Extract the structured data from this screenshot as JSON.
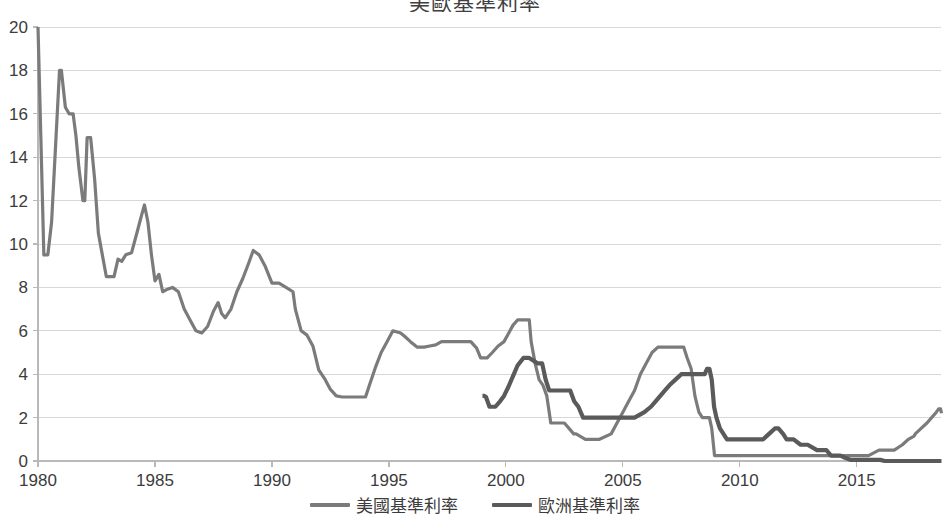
{
  "chart_data": {
    "type": "line",
    "title": "美歐基準利率",
    "xlabel": "",
    "ylabel": "",
    "xlim": [
      1980,
      2018.6
    ],
    "ylim": [
      0,
      20
    ],
    "ytick_values": [
      0,
      2,
      4,
      6,
      8,
      10,
      12,
      14,
      16,
      18,
      20
    ],
    "ytick_labels": [
      "0",
      "2",
      "4",
      "6",
      "8",
      "10",
      "12",
      "14",
      "16",
      "18",
      "20"
    ],
    "xtick_values": [
      1980,
      1985,
      1990,
      1995,
      2000,
      2005,
      2010,
      2015
    ],
    "xtick_labels": [
      "1980",
      "1985",
      "1990",
      "1995",
      "2000",
      "2005",
      "2010",
      "2015"
    ],
    "grid": "horizontal",
    "legend_position": "bottom",
    "series": [
      {
        "name": "美國基準利率",
        "color": "#7b7b7b",
        "width": 3.2,
        "points": [
          [
            1980.0,
            20.0
          ],
          [
            1980.12,
            15.0
          ],
          [
            1980.25,
            9.5
          ],
          [
            1980.42,
            9.5
          ],
          [
            1980.58,
            11.0
          ],
          [
            1980.75,
            14.5
          ],
          [
            1980.92,
            18.0
          ],
          [
            1981.0,
            18.0
          ],
          [
            1981.17,
            16.3
          ],
          [
            1981.33,
            16.0
          ],
          [
            1981.5,
            16.0
          ],
          [
            1981.62,
            15.0
          ],
          [
            1981.75,
            13.5
          ],
          [
            1981.92,
            12.0
          ],
          [
            1982.0,
            12.0
          ],
          [
            1982.1,
            14.9
          ],
          [
            1982.25,
            14.9
          ],
          [
            1982.42,
            13.0
          ],
          [
            1982.58,
            10.5
          ],
          [
            1982.75,
            9.5
          ],
          [
            1982.92,
            8.5
          ],
          [
            1983.0,
            8.5
          ],
          [
            1983.25,
            8.5
          ],
          [
            1983.42,
            9.3
          ],
          [
            1983.58,
            9.2
          ],
          [
            1983.75,
            9.5
          ],
          [
            1984.0,
            9.6
          ],
          [
            1984.25,
            10.6
          ],
          [
            1984.42,
            11.3
          ],
          [
            1984.55,
            11.8
          ],
          [
            1984.7,
            11.0
          ],
          [
            1984.85,
            9.5
          ],
          [
            1985.0,
            8.3
          ],
          [
            1985.17,
            8.6
          ],
          [
            1985.33,
            7.8
          ],
          [
            1985.5,
            7.9
          ],
          [
            1985.75,
            8.0
          ],
          [
            1986.0,
            7.8
          ],
          [
            1986.25,
            7.0
          ],
          [
            1986.5,
            6.5
          ],
          [
            1986.75,
            6.0
          ],
          [
            1987.0,
            5.9
          ],
          [
            1987.25,
            6.2
          ],
          [
            1987.5,
            6.9
          ],
          [
            1987.7,
            7.3
          ],
          [
            1987.85,
            6.8
          ],
          [
            1988.0,
            6.6
          ],
          [
            1988.25,
            7.0
          ],
          [
            1988.5,
            7.8
          ],
          [
            1988.75,
            8.4
          ],
          [
            1989.0,
            9.1
          ],
          [
            1989.2,
            9.7
          ],
          [
            1989.45,
            9.5
          ],
          [
            1989.7,
            9.0
          ],
          [
            1990.0,
            8.2
          ],
          [
            1990.3,
            8.2
          ],
          [
            1990.6,
            8.0
          ],
          [
            1990.9,
            7.8
          ],
          [
            1991.0,
            7.0
          ],
          [
            1991.25,
            6.0
          ],
          [
            1991.5,
            5.8
          ],
          [
            1991.75,
            5.3
          ],
          [
            1992.0,
            4.2
          ],
          [
            1992.25,
            3.8
          ],
          [
            1992.5,
            3.3
          ],
          [
            1992.75,
            3.0
          ],
          [
            1993.0,
            2.95
          ],
          [
            1993.5,
            2.95
          ],
          [
            1994.0,
            2.95
          ],
          [
            1994.17,
            3.5
          ],
          [
            1994.42,
            4.3
          ],
          [
            1994.67,
            5.0
          ],
          [
            1994.92,
            5.5
          ],
          [
            1995.17,
            6.0
          ],
          [
            1995.5,
            5.9
          ],
          [
            1995.67,
            5.75
          ],
          [
            1995.92,
            5.5
          ],
          [
            1996.2,
            5.25
          ],
          [
            1996.5,
            5.25
          ],
          [
            1996.75,
            5.3
          ],
          [
            1997.0,
            5.35
          ],
          [
            1997.25,
            5.5
          ],
          [
            1997.6,
            5.5
          ],
          [
            1998.0,
            5.5
          ],
          [
            1998.5,
            5.5
          ],
          [
            1998.75,
            5.2
          ],
          [
            1998.92,
            4.75
          ],
          [
            1999.2,
            4.75
          ],
          [
            1999.42,
            5.0
          ],
          [
            1999.67,
            5.3
          ],
          [
            1999.92,
            5.5
          ],
          [
            2000.1,
            5.85
          ],
          [
            2000.3,
            6.25
          ],
          [
            2000.5,
            6.5
          ],
          [
            2000.9,
            6.5
          ],
          [
            2001.0,
            6.5
          ],
          [
            2001.08,
            5.5
          ],
          [
            2001.25,
            4.5
          ],
          [
            2001.42,
            3.75
          ],
          [
            2001.58,
            3.5
          ],
          [
            2001.75,
            3.0
          ],
          [
            2001.92,
            1.75
          ],
          [
            2002.0,
            1.75
          ],
          [
            2002.5,
            1.75
          ],
          [
            2002.9,
            1.25
          ],
          [
            2003.0,
            1.25
          ],
          [
            2003.4,
            1.0
          ],
          [
            2003.6,
            1.0
          ],
          [
            2004.0,
            1.0
          ],
          [
            2004.5,
            1.25
          ],
          [
            2004.75,
            1.75
          ],
          [
            2005.0,
            2.25
          ],
          [
            2005.25,
            2.75
          ],
          [
            2005.5,
            3.25
          ],
          [
            2005.75,
            4.0
          ],
          [
            2006.0,
            4.5
          ],
          [
            2006.25,
            5.0
          ],
          [
            2006.5,
            5.25
          ],
          [
            2006.9,
            5.25
          ],
          [
            2007.4,
            5.25
          ],
          [
            2007.6,
            5.25
          ],
          [
            2007.75,
            4.75
          ],
          [
            2007.92,
            4.25
          ],
          [
            2008.08,
            3.0
          ],
          [
            2008.25,
            2.25
          ],
          [
            2008.4,
            2.0
          ],
          [
            2008.7,
            2.0
          ],
          [
            2008.8,
            1.5
          ],
          [
            2008.92,
            0.25
          ],
          [
            2009.0,
            0.25
          ],
          [
            2010.0,
            0.25
          ],
          [
            2011.0,
            0.25
          ],
          [
            2012.0,
            0.25
          ],
          [
            2013.0,
            0.25
          ],
          [
            2014.0,
            0.25
          ],
          [
            2014.8,
            0.25
          ],
          [
            2015.0,
            0.25
          ],
          [
            2015.5,
            0.25
          ],
          [
            2015.95,
            0.5
          ],
          [
            2016.3,
            0.5
          ],
          [
            2016.6,
            0.5
          ],
          [
            2016.95,
            0.75
          ],
          [
            2017.2,
            1.0
          ],
          [
            2017.45,
            1.15
          ],
          [
            2017.5,
            1.25
          ],
          [
            2017.75,
            1.5
          ],
          [
            2018.0,
            1.75
          ],
          [
            2018.2,
            2.0
          ],
          [
            2018.4,
            2.25
          ],
          [
            2018.5,
            2.4
          ],
          [
            2018.58,
            2.4
          ],
          [
            2018.62,
            2.2
          ]
        ]
      },
      {
        "name": "歐洲基準利率",
        "color": "#5a5a5a",
        "width": 4.2,
        "points": [
          [
            1999.0,
            3.0
          ],
          [
            1999.08,
            3.0
          ],
          [
            1999.15,
            2.95
          ],
          [
            1999.3,
            2.5
          ],
          [
            1999.55,
            2.5
          ],
          [
            1999.75,
            2.75
          ],
          [
            1999.92,
            3.0
          ],
          [
            2000.1,
            3.4
          ],
          [
            2000.3,
            3.9
          ],
          [
            2000.5,
            4.4
          ],
          [
            2000.75,
            4.75
          ],
          [
            2001.0,
            4.75
          ],
          [
            2001.35,
            4.5
          ],
          [
            2001.55,
            4.5
          ],
          [
            2001.7,
            3.75
          ],
          [
            2001.85,
            3.25
          ],
          [
            2002.0,
            3.25
          ],
          [
            2002.4,
            3.25
          ],
          [
            2002.75,
            3.25
          ],
          [
            2002.92,
            2.75
          ],
          [
            2003.1,
            2.5
          ],
          [
            2003.3,
            2.0
          ],
          [
            2003.5,
            2.0
          ],
          [
            2004.0,
            2.0
          ],
          [
            2004.5,
            2.0
          ],
          [
            2005.0,
            2.0
          ],
          [
            2005.5,
            2.0
          ],
          [
            2005.92,
            2.25
          ],
          [
            2006.2,
            2.5
          ],
          [
            2006.4,
            2.75
          ],
          [
            2006.6,
            3.0
          ],
          [
            2006.8,
            3.25
          ],
          [
            2007.0,
            3.5
          ],
          [
            2007.25,
            3.75
          ],
          [
            2007.5,
            4.0
          ],
          [
            2007.75,
            4.0
          ],
          [
            2008.0,
            4.0
          ],
          [
            2008.5,
            4.0
          ],
          [
            2008.6,
            4.25
          ],
          [
            2008.7,
            4.25
          ],
          [
            2008.8,
            3.75
          ],
          [
            2008.9,
            2.5
          ],
          [
            2009.0,
            2.0
          ],
          [
            2009.15,
            1.5
          ],
          [
            2009.3,
            1.25
          ],
          [
            2009.45,
            1.0
          ],
          [
            2009.7,
            1.0
          ],
          [
            2010.0,
            1.0
          ],
          [
            2010.5,
            1.0
          ],
          [
            2011.0,
            1.0
          ],
          [
            2011.25,
            1.25
          ],
          [
            2011.5,
            1.5
          ],
          [
            2011.65,
            1.5
          ],
          [
            2011.85,
            1.25
          ],
          [
            2012.0,
            1.0
          ],
          [
            2012.3,
            1.0
          ],
          [
            2012.6,
            0.75
          ],
          [
            2012.9,
            0.75
          ],
          [
            2013.3,
            0.5
          ],
          [
            2013.7,
            0.5
          ],
          [
            2013.9,
            0.25
          ],
          [
            2014.3,
            0.25
          ],
          [
            2014.5,
            0.15
          ],
          [
            2014.75,
            0.05
          ],
          [
            2015.0,
            0.05
          ],
          [
            2015.5,
            0.05
          ],
          [
            2016.0,
            0.05
          ],
          [
            2016.2,
            0.0
          ],
          [
            2016.6,
            0.0
          ],
          [
            2017.0,
            0.0
          ],
          [
            2017.5,
            0.0
          ],
          [
            2018.0,
            0.0
          ],
          [
            2018.62,
            0.0
          ]
        ]
      }
    ]
  },
  "legend": {
    "items": [
      {
        "label": "美國基準利率",
        "color": "#7b7b7b"
      },
      {
        "label": "歐洲基準利率",
        "color": "#5a5a5a"
      }
    ]
  },
  "axes": {
    "plot_left": 38,
    "plot_right": 941,
    "plot_top": 27,
    "plot_bottom": 461
  }
}
